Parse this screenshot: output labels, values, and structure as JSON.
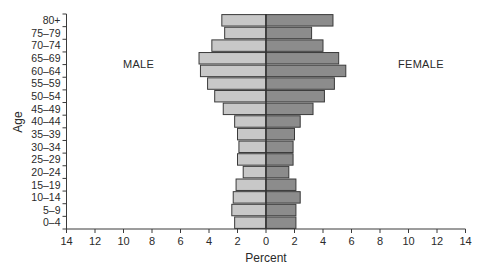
{
  "chart_data": {
    "type": "bar",
    "subtype": "population-pyramid",
    "orientation": "horizontal",
    "title": "",
    "xlabel": "Percent",
    "ylabel": "Age",
    "xlim": [
      -14,
      14
    ],
    "x_ticks": [
      14,
      12,
      10,
      8,
      6,
      4,
      2,
      0,
      2,
      4,
      6,
      8,
      10,
      12,
      14
    ],
    "grid": false,
    "legend": "none",
    "annotations": [
      {
        "text": "MALE",
        "side": "left"
      },
      {
        "text": "FEMALE",
        "side": "right"
      }
    ],
    "categories": [
      "80+",
      "75–79",
      "70–74",
      "65–69",
      "60–64",
      "55–59",
      "50–54",
      "45–49",
      "40–44",
      "35–39",
      "30–34",
      "25–29",
      "20–24",
      "15–19",
      "10–14",
      "5–9",
      "0–4"
    ],
    "series": [
      {
        "name": "Male",
        "color": "#c8c8c8",
        "side": "left",
        "values": [
          3.1,
          2.9,
          3.8,
          4.7,
          4.6,
          4.1,
          3.6,
          3.0,
          2.2,
          2.0,
          1.9,
          2.0,
          1.6,
          2.1,
          2.3,
          2.4,
          2.2
        ]
      },
      {
        "name": "Female",
        "color": "#8c8c8c",
        "side": "right",
        "values": [
          4.7,
          3.2,
          4.0,
          5.1,
          5.6,
          4.8,
          4.1,
          3.3,
          2.4,
          2.0,
          1.9,
          1.9,
          1.6,
          2.1,
          2.4,
          2.1,
          2.1
        ]
      }
    ]
  },
  "labels": {
    "male": "MALE",
    "female": "FEMALE",
    "x_axis_title": "Percent",
    "y_axis_title": "Age"
  },
  "colors": {
    "male_fill": "#c8c8c8",
    "female_fill": "#8c8c8c",
    "outline": "#3a3a3a",
    "axis": "#3a3a3a"
  }
}
